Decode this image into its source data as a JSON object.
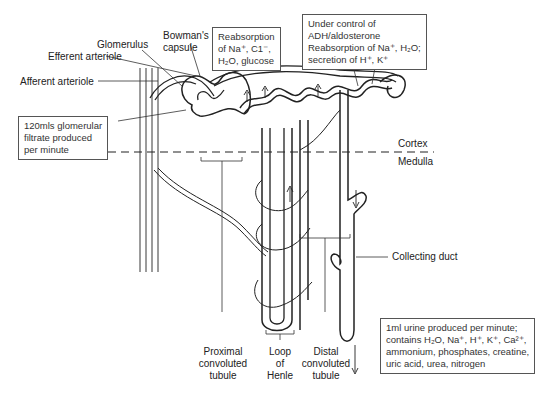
{
  "diagram": {
    "labels": {
      "glomerulus": "Glomerulus",
      "bowmans_capsule": [
        "Bowman's",
        "capsule"
      ],
      "efferent_arteriole": "Efferent arteriole",
      "afferent_arteriole": "Afferent arteriole",
      "cortex": "Cortex",
      "medulla": "Medulla",
      "collecting_duct": "Collecting duct",
      "proximal_tubule": [
        "Proximal",
        "convoluted",
        "tubule"
      ],
      "loop_of_henle": [
        "Loop",
        "of",
        "Henle"
      ],
      "distal_tubule": [
        "Distal",
        "convoluted",
        "tubule"
      ]
    },
    "boxes": {
      "filtrate": [
        "120mls glomerular",
        "filtrate produced",
        "per minute"
      ],
      "proximal_reabsorption": [
        "Reabsorption",
        "of Na⁺, C1⁻,",
        "H₂O, glucose"
      ],
      "distal_control": [
        "Under control of",
        "ADH/aldosterone",
        "Reabsorption of Na⁺, H₂O;",
        "secretion of H⁺, K⁺"
      ],
      "urine": [
        "1ml urine produced per minute;",
        "contains H₂O, Na⁺, H⁺, K⁺, Ca²⁺,",
        "ammonium, phosphates, creatine,",
        "uric acid, urea, nitrogen"
      ]
    },
    "colors": {
      "line": "#222222",
      "box_border": "#555555",
      "background": "#ffffff"
    }
  }
}
